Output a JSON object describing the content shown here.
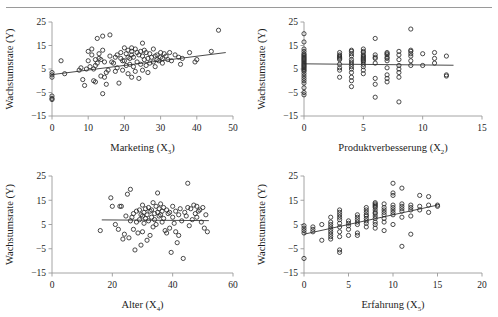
{
  "figure": {
    "kind": "scatter-panel-grid",
    "rows": 2,
    "columns": 2,
    "marker_style": "open-circle",
    "marker_color": "#2b2b2b",
    "trendline_color": "#4a4a4a",
    "axis_color": "#9a9a9a",
    "background": "#ffffff",
    "shared_ylabel": "Wachstumsrate (Y)",
    "ytick_labels": [
      "25",
      "15",
      "5",
      "-5",
      "-15"
    ]
  },
  "chart_data": [
    {
      "type": "scatter",
      "panel": "top-left",
      "title": "",
      "xlabel": "Marketing (X",
      "xlabel_sub": "3",
      "xlabel_tail": ")",
      "ylabel": "Wachstumsrate (Y)",
      "xlim": [
        0,
        50
      ],
      "ylim": [
        -15,
        25
      ],
      "xticks": [
        0,
        10,
        20,
        30,
        40,
        50
      ],
      "yticks": [
        -15,
        -5,
        5,
        15,
        25
      ],
      "grid": false,
      "legend": "none",
      "trendline": {
        "type": "linear",
        "x0": 0,
        "y0": 2.6,
        "x1": 48,
        "y1": 12.0
      },
      "x": [
        0,
        0,
        0,
        0,
        0,
        0,
        2.5,
        3.5,
        7.5,
        8,
        8.5,
        9,
        9.5,
        10,
        10,
        10.5,
        11,
        11,
        11.5,
        11.5,
        12,
        12,
        12,
        12.5,
        12.5,
        13,
        13,
        13.5,
        13.5,
        14,
        14,
        14,
        14.5,
        14.5,
        15,
        15,
        15.5,
        16,
        16,
        16.5,
        17,
        17.5,
        17.5,
        18,
        18,
        18.5,
        19,
        19,
        19.5,
        19.5,
        20,
        20,
        20.5,
        20.5,
        21,
        21,
        21,
        21.5,
        21.5,
        22,
        22,
        22,
        22,
        22.5,
        22.5,
        23,
        23,
        23.5,
        23.5,
        24,
        24,
        24.5,
        24.5,
        25,
        25,
        25,
        25.5,
        25.5,
        26,
        26,
        26.5,
        26.5,
        27,
        27,
        27.5,
        28,
        28,
        28.5,
        28.5,
        29,
        29,
        29.5,
        30,
        30,
        30.5,
        30.5,
        31,
        31.5,
        32,
        32.5,
        33,
        34,
        35,
        35.5,
        36,
        38,
        39.5,
        40,
        44,
        46
      ],
      "y": [
        3.5,
        2.5,
        1.5,
        -6.5,
        -7.5,
        -8,
        8.5,
        3.0,
        4.5,
        5.5,
        0.5,
        -2.0,
        5.0,
        12.5,
        8.5,
        6.0,
        13.5,
        11.0,
        5.0,
        0.0,
        9.0,
        6.5,
        -0.5,
        18.0,
        7.5,
        11.5,
        9.5,
        9.0,
        2.0,
        19.0,
        13.0,
        -5.5,
        8.0,
        1.5,
        3.5,
        -1.5,
        4.5,
        19.5,
        10.5,
        8.0,
        7.5,
        10.0,
        4.0,
        11.0,
        5.5,
        -1.0,
        12.0,
        9.5,
        8.5,
        4.5,
        14.0,
        8.5,
        11.5,
        6.5,
        13.0,
        10.0,
        3.0,
        9.5,
        7.0,
        14.0,
        12.5,
        11.0,
        1.5,
        10.0,
        6.0,
        13.5,
        4.0,
        12.0,
        8.0,
        11.0,
        1.0,
        12.5,
        7.0,
        16.0,
        10.5,
        4.5,
        13.0,
        9.0,
        12.0,
        6.5,
        9.5,
        3.5,
        11.5,
        7.5,
        10.0,
        13.5,
        8.0,
        10.5,
        6.0,
        11.0,
        9.0,
        8.5,
        12.0,
        10.0,
        7.5,
        9.5,
        11.5,
        10.5,
        9.0,
        12.0,
        8.5,
        11.0,
        10.0,
        7.0,
        9.5,
        12.0,
        8.0,
        9.0,
        12.5,
        21.5,
        22.5
      ]
    },
    {
      "type": "scatter",
      "panel": "top-right",
      "title": "",
      "xlabel": "Produktverbesserung (X",
      "xlabel_sub": "2",
      "xlabel_tail": ")",
      "ylabel": "Wachstumsrate (Y)",
      "xlim": [
        0,
        15
      ],
      "ylim": [
        -15,
        25
      ],
      "xticks": [
        0,
        5,
        10,
        15
      ],
      "yticks": [
        -15,
        -5,
        5,
        15,
        25
      ],
      "grid": false,
      "legend": "none",
      "trendline": {
        "type": "linear",
        "x0": 0,
        "y0": 7.2,
        "x1": 12.6,
        "y1": 6.6
      },
      "x": [
        0,
        0,
        0,
        0,
        0,
        0,
        0,
        0,
        0,
        0,
        0,
        0,
        0,
        0,
        0,
        0,
        0,
        0,
        0,
        0,
        0,
        0,
        0,
        0,
        0,
        0,
        0,
        0,
        3,
        3,
        3,
        3,
        3,
        3,
        3,
        3,
        3,
        3,
        4,
        4,
        4,
        4,
        4,
        4,
        4,
        4,
        4,
        4,
        4,
        4,
        4,
        5,
        5,
        5,
        5,
        5,
        5,
        5,
        5,
        5,
        5,
        5,
        5,
        5,
        5,
        6,
        6,
        6,
        6,
        6,
        6,
        6,
        6,
        7,
        7,
        7,
        7,
        7,
        7,
        7,
        7,
        7,
        7,
        8,
        8,
        8,
        8,
        8,
        8,
        8,
        8,
        9,
        9,
        9,
        9,
        9,
        9,
        9,
        10,
        10,
        11,
        11,
        11,
        12,
        12,
        12
      ],
      "y": [
        20.0,
        16.5,
        13.5,
        12.5,
        11.5,
        11.0,
        10.5,
        10.0,
        9.5,
        9.0,
        8.5,
        8.0,
        7.5,
        7.0,
        6.5,
        6.0,
        5.5,
        5.0,
        4.5,
        4.0,
        3.0,
        2.0,
        1.0,
        0.0,
        -1.0,
        -3.0,
        -5.0,
        -6.0,
        12.0,
        11.0,
        10.5,
        10.0,
        9.5,
        9.0,
        7.0,
        5.5,
        4.5,
        1.5,
        13.0,
        12.5,
        11.5,
        10.5,
        9.0,
        8.0,
        7.0,
        6.0,
        5.0,
        3.5,
        1.5,
        0.0,
        -2.5,
        13.5,
        12.5,
        12.0,
        11.0,
        10.5,
        10.0,
        9.5,
        9.0,
        8.5,
        8.0,
        7.0,
        6.0,
        4.5,
        3.0,
        18.0,
        11.0,
        10.0,
        9.5,
        7.5,
        1.0,
        -1.5,
        -7.0,
        12.0,
        11.5,
        11.0,
        10.0,
        9.5,
        8.5,
        5.5,
        2.5,
        1.0,
        -0.5,
        12.5,
        11.0,
        9.0,
        6.5,
        5.0,
        3.5,
        1.5,
        -9.0,
        22.0,
        13.0,
        12.5,
        11.5,
        10.5,
        8.5,
        6.5,
        11.5,
        6.5,
        12.0,
        9.5,
        7.5,
        10.5,
        2.5,
        2.0
      ]
    },
    {
      "type": "scatter",
      "panel": "bottom-left",
      "title": "",
      "xlabel": "Alter (X",
      "xlabel_sub": "4",
      "xlabel_tail": ")",
      "ylabel": "Wachstumsrate (Y)",
      "xlim": [
        0,
        60
      ],
      "ylim": [
        -15,
        25
      ],
      "xticks": [
        0,
        20,
        40,
        60
      ],
      "yticks": [
        -15,
        -5,
        5,
        15,
        25
      ],
      "grid": false,
      "legend": "none",
      "trendline": {
        "type": "linear",
        "x0": 16.5,
        "y0": 6.9,
        "x1": 52,
        "y1": 6.6
      },
      "x": [
        16,
        19.5,
        20,
        21,
        22,
        22.5,
        23,
        23.5,
        24,
        24.5,
        25,
        25.5,
        26,
        26,
        26.5,
        27,
        27,
        27.5,
        28,
        28,
        28.5,
        29,
        29,
        29.5,
        29.5,
        30,
        30,
        30,
        30.5,
        30.5,
        31,
        31,
        31.5,
        31.5,
        32,
        32,
        32.5,
        32.5,
        33,
        33,
        33.5,
        33.5,
        34,
        34,
        34.5,
        34.5,
        35,
        35,
        35.5,
        35.5,
        36,
        36,
        36.5,
        36.5,
        37,
        37,
        37.5,
        38,
        38,
        38.5,
        39,
        39,
        39.5,
        40,
        40,
        40.5,
        41,
        41,
        41.5,
        42,
        42,
        42.5,
        43,
        43.5,
        44,
        44.5,
        45,
        45,
        45.5,
        46,
        46.5,
        47,
        47.5,
        48,
        48,
        48.5,
        49,
        49.5,
        50,
        50.5,
        51,
        51.5
      ],
      "y": [
        2.5,
        16.0,
        12.5,
        5.0,
        3.0,
        12.5,
        12.5,
        -1.0,
        1.0,
        8.5,
        17.5,
        -0.5,
        19.5,
        6.5,
        8.0,
        9.5,
        3.0,
        -5.5,
        10.5,
        6.0,
        1.5,
        11.0,
        7.0,
        9.0,
        -3.5,
        13.0,
        8.5,
        2.0,
        10.0,
        5.5,
        11.5,
        7.5,
        9.0,
        -1.5,
        12.0,
        6.5,
        10.5,
        0.5,
        11.0,
        8.0,
        14.0,
        4.0,
        9.5,
        7.0,
        12.5,
        5.0,
        18.0,
        10.0,
        11.5,
        8.5,
        13.5,
        9.0,
        10.5,
        6.0,
        12.0,
        7.5,
        2.5,
        11.0,
        1.5,
        9.5,
        10.0,
        3.5,
        -6.5,
        12.5,
        8.0,
        5.5,
        10.5,
        2.0,
        -2.5,
        9.0,
        0.5,
        11.5,
        6.5,
        -9.0,
        10.0,
        8.5,
        22.0,
        12.0,
        4.5,
        11.5,
        7.0,
        13.0,
        9.5,
        12.5,
        8.0,
        10.5,
        11.0,
        6.0,
        12.0,
        3.5,
        9.0,
        2.0
      ]
    },
    {
      "type": "scatter",
      "panel": "bottom-right",
      "title": "",
      "xlabel": "Erfahrung (X",
      "xlabel_sub": "5",
      "xlabel_tail": ")",
      "ylabel": "Wachstumsrate (Y)",
      "xlim": [
        0,
        20
      ],
      "ylim": [
        -15,
        25
      ],
      "xticks": [
        0,
        5,
        10,
        15,
        20
      ],
      "yticks": [
        -15,
        -5,
        5,
        15,
        25
      ],
      "grid": false,
      "legend": "none",
      "trendline": {
        "type": "linear",
        "x0": 0,
        "y0": 1.0,
        "x1": 15,
        "y1": 13.0
      },
      "x": [
        0,
        0,
        0,
        0,
        0,
        1,
        1,
        1,
        2,
        2,
        3,
        3,
        3,
        3,
        3,
        3,
        3,
        3,
        3,
        4,
        4,
        4,
        4,
        4,
        4,
        4,
        4,
        4,
        4,
        4,
        5,
        5,
        5,
        5,
        5,
        6,
        6,
        6,
        6,
        6,
        6,
        6,
        7,
        7,
        7,
        7,
        7,
        7,
        7,
        7,
        7,
        8,
        8,
        8,
        8,
        8,
        8,
        8,
        8,
        8,
        8,
        8,
        8,
        8,
        9,
        9,
        9,
        9,
        9,
        9,
        9,
        9,
        10,
        10,
        10,
        10,
        10,
        10,
        10,
        10,
        10,
        11,
        11,
        11,
        11,
        11,
        11,
        11,
        12,
        12,
        12,
        12,
        12,
        13,
        13,
        13,
        14,
        14,
        14,
        15,
        15
      ],
      "y": [
        4.5,
        3.5,
        2.5,
        1.5,
        -9.0,
        4.0,
        3.0,
        2.0,
        5.0,
        -1.5,
        8.0,
        6.0,
        5.0,
        4.0,
        3.0,
        2.0,
        1.0,
        0.0,
        -1.0,
        11.0,
        10.0,
        9.0,
        8.0,
        7.0,
        5.5,
        4.0,
        2.0,
        0.0,
        -5.5,
        -6.5,
        6.5,
        5.5,
        4.5,
        3.0,
        0.5,
        9.0,
        8.0,
        7.0,
        6.0,
        5.0,
        1.5,
        0.5,
        12.0,
        11.0,
        10.0,
        9.0,
        8.5,
        7.5,
        6.5,
        5.5,
        4.0,
        14.0,
        13.5,
        13.0,
        12.5,
        12.0,
        11.0,
        10.0,
        9.5,
        8.5,
        7.5,
        6.0,
        5.0,
        3.5,
        13.5,
        12.0,
        11.0,
        10.0,
        9.0,
        7.5,
        6.0,
        2.5,
        22.0,
        18.0,
        17.0,
        13.0,
        12.0,
        11.0,
        10.0,
        9.0,
        5.0,
        20.0,
        13.5,
        12.5,
        11.5,
        10.5,
        8.0,
        -4.0,
        13.0,
        12.0,
        11.0,
        8.5,
        1.0,
        17.0,
        12.5,
        11.0,
        16.5,
        13.0,
        10.0,
        13.0,
        12.5
      ]
    }
  ]
}
